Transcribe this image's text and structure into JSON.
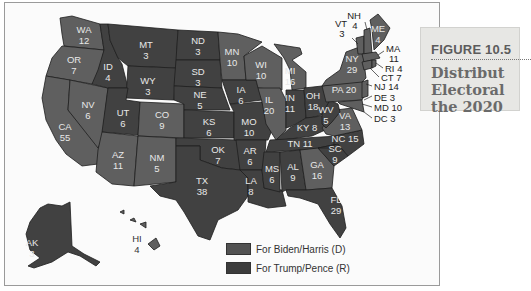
{
  "figure": {
    "number": "FIGURE 10.5",
    "title_lines": [
      "Distribut",
      "Electoral",
      "the 2020"
    ]
  },
  "legend": {
    "items": [
      {
        "label": "For Biden/Harris (D)",
        "color": "#5a5a5a"
      },
      {
        "label": "For Trump/Pence (R)",
        "color": "#3c3c3c"
      }
    ]
  },
  "colors": {
    "biden": "#5f5f5f",
    "trump": "#414141",
    "label": "#e8e8e8",
    "border": "#1e1e1e"
  },
  "states": {
    "WA": {
      "abbr": "WA",
      "votes": "12",
      "winner": "D"
    },
    "OR": {
      "abbr": "OR",
      "votes": "7",
      "winner": "D"
    },
    "CA": {
      "abbr": "CA",
      "votes": "55",
      "winner": "D"
    },
    "NV": {
      "abbr": "NV",
      "votes": "6",
      "winner": "D"
    },
    "ID": {
      "abbr": "ID",
      "votes": "4",
      "winner": "R"
    },
    "MT": {
      "abbr": "MT",
      "votes": "3",
      "winner": "R"
    },
    "WY": {
      "abbr": "WY",
      "votes": "3",
      "winner": "R"
    },
    "UT": {
      "abbr": "UT",
      "votes": "6",
      "winner": "R"
    },
    "CO": {
      "abbr": "CO",
      "votes": "9",
      "winner": "D"
    },
    "AZ": {
      "abbr": "AZ",
      "votes": "11",
      "winner": "D"
    },
    "NM": {
      "abbr": "NM",
      "votes": "5",
      "winner": "D"
    },
    "ND": {
      "abbr": "ND",
      "votes": "3",
      "winner": "R"
    },
    "SD": {
      "abbr": "SD",
      "votes": "3",
      "winner": "R"
    },
    "NE": {
      "abbr": "NE",
      "votes": "5",
      "winner": "R"
    },
    "KS": {
      "abbr": "KS",
      "votes": "6",
      "winner": "R"
    },
    "OK": {
      "abbr": "OK",
      "votes": "7",
      "winner": "R"
    },
    "TX": {
      "abbr": "TX",
      "votes": "38",
      "winner": "R"
    },
    "MN": {
      "abbr": "MN",
      "votes": "10",
      "winner": "D"
    },
    "IA": {
      "abbr": "IA",
      "votes": "6",
      "winner": "R"
    },
    "MO": {
      "abbr": "MO",
      "votes": "10",
      "winner": "R"
    },
    "AR": {
      "abbr": "AR",
      "votes": "6",
      "winner": "R"
    },
    "LA": {
      "abbr": "LA",
      "votes": "8",
      "winner": "R"
    },
    "WI": {
      "abbr": "WI",
      "votes": "10",
      "winner": "D"
    },
    "IL": {
      "abbr": "IL",
      "votes": "20",
      "winner": "D"
    },
    "MI": {
      "abbr": "MI",
      "votes": "16",
      "winner": "D"
    },
    "IN": {
      "abbr": "IN",
      "votes": "11",
      "winner": "R"
    },
    "OH": {
      "abbr": "OH",
      "votes": "18",
      "winner": "R"
    },
    "KY": {
      "abbr": "KY",
      "votes": "8",
      "winner": "R"
    },
    "TN": {
      "abbr": "TN",
      "votes": "11",
      "winner": "R"
    },
    "MS": {
      "abbr": "MS",
      "votes": "6",
      "winner": "R"
    },
    "AL": {
      "abbr": "AL",
      "votes": "9",
      "winner": "R"
    },
    "GA": {
      "abbr": "GA",
      "votes": "16",
      "winner": "D"
    },
    "FL": {
      "abbr": "FL",
      "votes": "29",
      "winner": "R"
    },
    "SC": {
      "abbr": "SC",
      "votes": "9",
      "winner": "R"
    },
    "NC": {
      "abbr": "NC",
      "votes": "15",
      "winner": "R"
    },
    "VA": {
      "abbr": "VA",
      "votes": "13",
      "winner": "D"
    },
    "WV": {
      "abbr": "WV",
      "votes": "5",
      "winner": "R"
    },
    "PA": {
      "abbr": "PA",
      "votes": "20",
      "winner": "D"
    },
    "NY": {
      "abbr": "NY",
      "votes": "29",
      "winner": "D"
    },
    "VT": {
      "abbr": "VT",
      "votes": "3",
      "winner": "D"
    },
    "NH": {
      "abbr": "NH",
      "votes": "4",
      "winner": "D"
    },
    "ME": {
      "abbr": "ME",
      "votes": "4",
      "winner": "D"
    },
    "MA": {
      "abbr": "MA",
      "votes": "11",
      "winner": "D"
    },
    "RI": {
      "label": "RI 4",
      "winner": "D"
    },
    "CT": {
      "label": "CT 7",
      "winner": "D"
    },
    "NJ": {
      "label": "NJ 14",
      "winner": "D"
    },
    "DE": {
      "label": "DE 3",
      "winner": "D"
    },
    "MD": {
      "label": "MD 10",
      "winner": "D"
    },
    "DC": {
      "label": "DC 3",
      "winner": "D"
    },
    "AK": {
      "abbr": "AK",
      "votes": "3",
      "winner": "R"
    },
    "HI": {
      "abbr": "HI",
      "votes": "4",
      "winner": "D"
    }
  },
  "inline_labels": {
    "PA": "PA 20",
    "KY": "KY 8",
    "TN": "TN 11",
    "NC": "NC 15"
  }
}
